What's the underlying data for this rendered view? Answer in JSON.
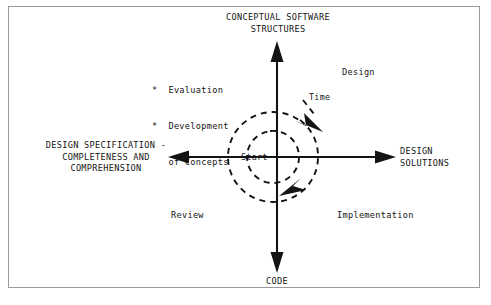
{
  "figure": {
    "type": "spiral-quadrant-diagram",
    "background_color": "#ffffff",
    "frame_color": "#9a9a9a",
    "ink_color": "#141414"
  },
  "axes": {
    "vertical": {
      "top_label": "CONCEPTUAL SOFTWARE\nSTRUCTURES",
      "bottom_label": "CODE"
    },
    "horizontal": {
      "left_label": "DESIGN SPECIFICATION -\nCOMPLETENESS AND\nCOMPREHENSION",
      "right_label": "DESIGN\nSOLUTIONS"
    }
  },
  "quadrants": {
    "top_right": "Design",
    "bottom_right": "Implementation",
    "bottom_left": "Review",
    "top_left_bullets": [
      "*  Evaluation",
      "*  Development",
      "   of Concepts"
    ]
  },
  "spiral": {
    "center_label": "Start",
    "direction_label": "Time",
    "style": "dashed",
    "turns": 2
  }
}
